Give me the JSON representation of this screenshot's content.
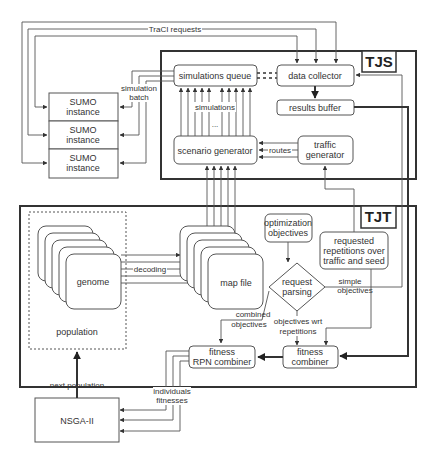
{
  "groups": {
    "tjs": "TJS",
    "tjt": "TJT",
    "population": "population"
  },
  "nodes": {
    "sumo": [
      "SUMO",
      "instance"
    ],
    "simulations_queue": "simulations queue",
    "data_collector": "data collector",
    "results_buffer": "results buffer",
    "scenario_generator": "scenario generator",
    "traffic_generator": [
      "traffic",
      "generator"
    ],
    "genome": "genome",
    "map_file": "map file",
    "optimization_objectives": [
      "optimization",
      "objectives"
    ],
    "requested_repetitions": [
      "requested",
      "repetitions over",
      "traffic and seed"
    ],
    "request_parsing": [
      "request",
      "parsing"
    ],
    "fitness_rpn_combiner": [
      "fitness",
      "RPN combiner"
    ],
    "fitness_combiner": [
      "fitness",
      "combiner"
    ],
    "nsga": "NSGA-II"
  },
  "edge_labels": {
    "traci_requests": "TraCI requests",
    "simulation_batch": [
      "simulation",
      "batch"
    ],
    "simulations": "simulations",
    "ellipsis": "...",
    "routes": "routes",
    "decoding": "decoding",
    "simple_objectives": [
      "simple",
      "objectives"
    ],
    "combined_objectives": [
      "combined",
      "objectives"
    ],
    "objectives_wrt_repetitions": [
      "objectives wrt",
      "repetitions"
    ],
    "next_population": "next population",
    "individuals_fitnesses": [
      "individuals",
      "fitnesses"
    ]
  }
}
